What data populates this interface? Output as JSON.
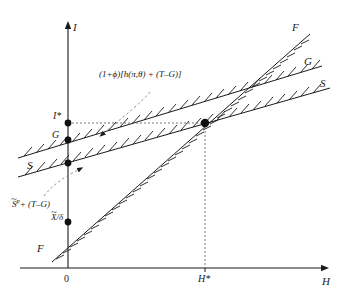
{
  "figure": {
    "background": "#ffffff",
    "ink": "#1a1a1a"
  },
  "axes": {
    "y_label": "I",
    "x_label": "H",
    "origin_label": "0",
    "x_tick_label": "H*",
    "y_tick_label": "I*",
    "x_range_note": "H",
    "y_range_note": "I"
  },
  "curves": [
    {
      "id": "F",
      "label_right": "F",
      "label_left": "F",
      "description": "steepest locus, hatched, passes through X-tilde-over-delta on vertical axis",
      "color": "#1a1a1a"
    },
    {
      "id": "G",
      "label_right": "G",
      "label_left": "G",
      "description": "middle locus, hatched, intercept labelled G on vertical axis",
      "color": "#1a1a1a"
    },
    {
      "id": "S",
      "label_right": "S",
      "label_left": "S",
      "description": "flattest locus, hatched, saving schedule",
      "color": "#1a1a1a"
    }
  ],
  "annotations": {
    "upper": {
      "text": "(1+ϕ)[h(π,θ) + (T–G)]",
      "points_to": "G-curve"
    },
    "lower": {
      "text_prefix": "S",
      "text_sup": "p",
      "text_suffix": "+ (T–G)",
      "points_to": "S-curve"
    },
    "axis_point": {
      "text_base": "X",
      "text_denom": "/δ"
    }
  },
  "markers": {
    "equilibrium": {
      "name": "equilibrium-point",
      "x_label": "H*",
      "y_label": "I*"
    },
    "intercepts": [
      {
        "name": "i-star-intercept",
        "label": "I*"
      },
      {
        "name": "g-intercept",
        "label": "G"
      },
      {
        "name": "s-intercept",
        "label": ""
      },
      {
        "name": "f-intercept",
        "label": "X/δ"
      }
    ]
  },
  "guides": {
    "horizontal_dotted": "I* level from axis to equilibrium",
    "vertical_dotted": "H* level from axis to equilibrium"
  }
}
